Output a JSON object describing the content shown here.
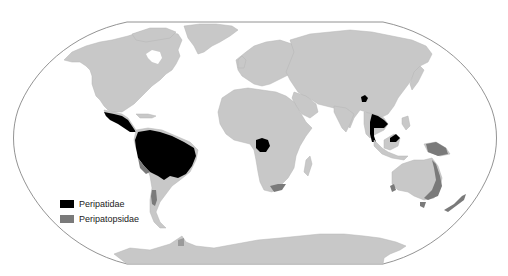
{
  "map": {
    "projection": "Robinson-like world map",
    "background": "#ffffff",
    "land_color": "#c8c8c8",
    "outline_color": "#777777"
  },
  "legend": {
    "items": [
      {
        "label": "Peripatidae",
        "color": "#000000"
      },
      {
        "label": "Peripatopsidae",
        "color": "#7a7a7a"
      }
    ]
  },
  "regions": {
    "peripatidae": [
      "Central America",
      "Northern South America / Amazon",
      "West-central Africa (Gabon/Cameroon)",
      "Northeast India/Myanmar",
      "Thailand / Malay Peninsula",
      "Borneo"
    ],
    "peripatopsidae": [
      "Chile",
      "South Africa",
      "New Guinea",
      "Eastern Australia",
      "Southwest Australia",
      "Tasmania",
      "New Zealand",
      "Southern Brazil margin"
    ]
  }
}
